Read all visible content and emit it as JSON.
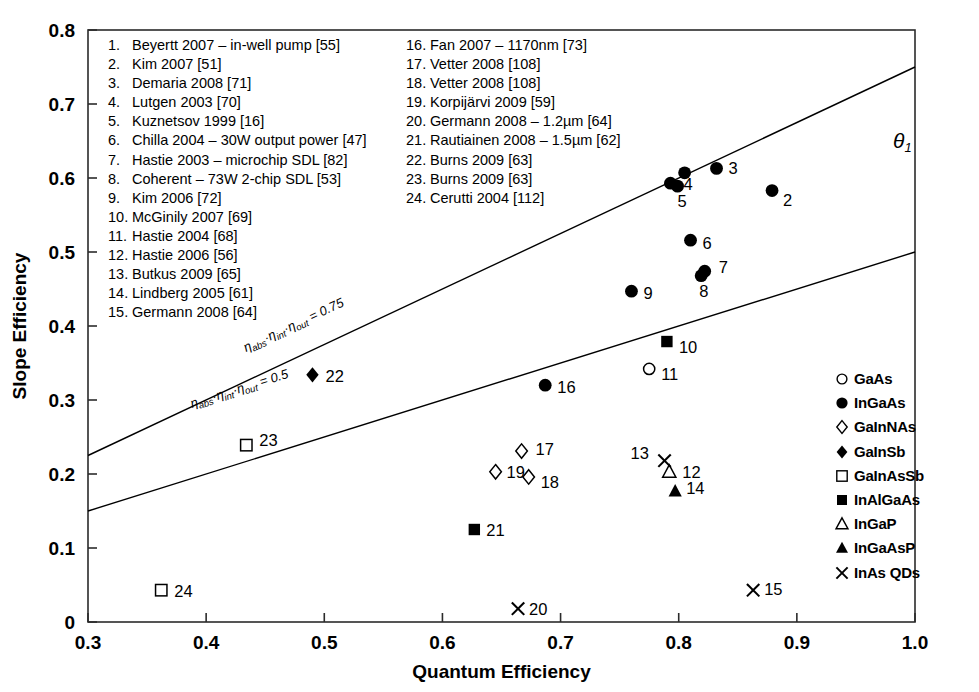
{
  "chart_data": {
    "type": "scatter",
    "title": "",
    "xlabel": "Quantum Efficiency",
    "ylabel": "Slope Efficiency",
    "xlim": [
      0.3,
      1.0
    ],
    "ylim": [
      0.0,
      0.8
    ],
    "xticks": [
      "0.3",
      "0.4",
      "0.5",
      "0.6",
      "0.7",
      "0.8",
      "0.9",
      "1.0"
    ],
    "xtick_values": [
      0.3,
      0.4,
      0.5,
      0.6,
      0.7,
      0.8,
      0.9,
      1.0
    ],
    "yticks": [
      "0",
      "0.1",
      "0.2",
      "0.3",
      "0.4",
      "0.5",
      "0.6",
      "0.7",
      "0.8"
    ],
    "ytick_values": [
      0.0,
      0.1,
      0.2,
      0.3,
      0.4,
      0.5,
      0.6,
      0.7,
      0.8
    ],
    "grid": false,
    "legend_position": "right-bottom",
    "points": [
      {
        "id": 1,
        "x": 0.793,
        "y": 0.593,
        "marker": "filled-circle",
        "material": "InGaAs",
        "label": "4",
        "label_dx": 13,
        "label_dy": 7
      },
      {
        "id": 2,
        "x": 0.879,
        "y": 0.583,
        "marker": "filled-circle",
        "material": "InGaAs",
        "label": "2",
        "label_dx": 11,
        "label_dy": 15
      },
      {
        "id": 3,
        "x": 0.832,
        "y": 0.613,
        "marker": "filled-circle",
        "material": "InGaAs",
        "label": "3",
        "label_dx": 12,
        "label_dy": 6
      },
      {
        "id": 4,
        "x": 0.805,
        "y": 0.607,
        "marker": "filled-circle",
        "material": "InGaAs",
        "label": "",
        "label_dx": 0,
        "label_dy": 0
      },
      {
        "id": 5,
        "x": 0.799,
        "y": 0.589,
        "marker": "filled-circle",
        "material": "InGaAs",
        "label": "5",
        "label_dx": 0,
        "label_dy": 21
      },
      {
        "id": 6,
        "x": 0.81,
        "y": 0.516,
        "marker": "filled-circle",
        "material": "InGaAs",
        "label": "6",
        "label_dx": 12,
        "label_dy": 9
      },
      {
        "id": 7,
        "x": 0.822,
        "y": 0.474,
        "marker": "filled-circle",
        "material": "InGaAs",
        "label": "7",
        "label_dx": 14,
        "label_dy": 2
      },
      {
        "id": 8,
        "x": 0.819,
        "y": 0.468,
        "marker": "filled-circle",
        "material": "InGaAs",
        "label": "8",
        "label_dx": -2,
        "label_dy": 21
      },
      {
        "id": 9,
        "x": 0.76,
        "y": 0.447,
        "marker": "filled-circle",
        "material": "InGaAs",
        "label": "9",
        "label_dx": 12,
        "label_dy": 8
      },
      {
        "id": 10,
        "x": 0.79,
        "y": 0.379,
        "marker": "filled-square",
        "material": "InAlGaAs",
        "label": "10",
        "label_dx": 12,
        "label_dy": 11
      },
      {
        "id": 11,
        "x": 0.775,
        "y": 0.342,
        "marker": "open-circle",
        "material": "GaAs",
        "label": "11",
        "label_dx": 12,
        "label_dy": 11
      },
      {
        "id": 12,
        "x": 0.792,
        "y": 0.203,
        "marker": "open-triangle",
        "material": "InGaP",
        "label": "12",
        "label_dx": 13,
        "label_dy": 6
      },
      {
        "id": 13,
        "x": 0.788,
        "y": 0.218,
        "marker": "cross",
        "material": "InAs QDs",
        "label": "13",
        "label_dx": -34,
        "label_dy": -2
      },
      {
        "id": 14,
        "x": 0.797,
        "y": 0.177,
        "marker": "filled-triangle",
        "material": "InGaAsP",
        "label": "14",
        "label_dx": 11,
        "label_dy": 3
      },
      {
        "id": 15,
        "x": 0.863,
        "y": 0.043,
        "marker": "cross",
        "material": "InAs QDs",
        "label": "15",
        "label_dx": 11,
        "label_dy": 5
      },
      {
        "id": 16,
        "x": 0.687,
        "y": 0.32,
        "marker": "filled-circle",
        "material": "InGaAs",
        "label": "16",
        "label_dx": 12,
        "label_dy": 8
      },
      {
        "id": 17,
        "x": 0.667,
        "y": 0.231,
        "marker": "open-diamond",
        "material": "GaInNAs",
        "label": "17",
        "label_dx": 14,
        "label_dy": 4
      },
      {
        "id": 18,
        "x": 0.673,
        "y": 0.196,
        "marker": "open-diamond",
        "material": "GaInNAs",
        "label": "18",
        "label_dx": 12,
        "label_dy": 11
      },
      {
        "id": 19,
        "x": 0.645,
        "y": 0.203,
        "marker": "open-diamond",
        "material": "GaInNAs",
        "label": "19",
        "label_dx": 11,
        "label_dy": 6
      },
      {
        "id": 20,
        "x": 0.664,
        "y": 0.018,
        "marker": "cross",
        "material": "InAs QDs",
        "label": "20",
        "label_dx": 11,
        "label_dy": 6
      },
      {
        "id": 21,
        "x": 0.627,
        "y": 0.125,
        "marker": "filled-square",
        "material": "InAlGaAs",
        "label": "21",
        "label_dx": 12,
        "label_dy": 6
      },
      {
        "id": 22,
        "x": 0.49,
        "y": 0.334,
        "marker": "filled-diamond",
        "material": "GaInSb",
        "label": "22",
        "label_dx": 13,
        "label_dy": 7
      },
      {
        "id": 23,
        "x": 0.434,
        "y": 0.239,
        "marker": "open-square",
        "material": "GaInAsSb",
        "label": "23",
        "label_dx": 13,
        "label_dy": 1
      },
      {
        "id": 24,
        "x": 0.362,
        "y": 0.043,
        "marker": "open-square",
        "material": "GaInAsSb",
        "label": "24",
        "label_dx": 13,
        "label_dy": 7
      }
    ],
    "trend_lines": [
      {
        "name": "eta-075",
        "x0": 0.3,
        "y0": 0.225,
        "x1": 1.0,
        "y1": 0.75,
        "label": "η abs · η int · η out = 0.75"
      },
      {
        "name": "eta-050",
        "x0": 0.3,
        "y0": 0.15,
        "x1": 1.0,
        "y1": 0.5,
        "label": "η abs · η int · η out = 0.5"
      }
    ],
    "line_label_parts": {
      "upper": {
        "eta1": "η",
        "sub1": "abs",
        "dot1": "·",
        "eta2": "η",
        "sub2": "int",
        "dot2": "·",
        "eta3": "η",
        "sub3": "out",
        "eq": "= 0.75"
      },
      "lower": {
        "eta1": "η",
        "sub1": "abs",
        "dot1": "·",
        "eta2": "η",
        "sub2": "int",
        "dot2": "·",
        "eta3": "η",
        "sub3": "out",
        "eq": "= 0.5"
      }
    },
    "annotation": {
      "text": "θ",
      "subscript": "1"
    }
  },
  "references": {
    "column_1": [
      {
        "num": "1.",
        "text": "Beyertt 2007 – in-well pump  [55]"
      },
      {
        "num": "2.",
        "text": "Kim 2007  [51]"
      },
      {
        "num": "3.",
        "text": "Demaria 2008  [71]"
      },
      {
        "num": "4.",
        "text": "Lutgen 2003  [70]"
      },
      {
        "num": "5.",
        "text": "Kuznetsov 1999  [16]"
      },
      {
        "num": "6.",
        "text": "Chilla 2004 – 30W output power  [47]"
      },
      {
        "num": "7.",
        "text": "Hastie 2003 – microchip SDL  [82]"
      },
      {
        "num": "8.",
        "text": "Coherent – 73W 2-chip SDL  [53]"
      },
      {
        "num": "9.",
        "text": "Kim 2006  [72]"
      },
      {
        "num": "10.",
        "text": "McGinily 2007  [69]"
      },
      {
        "num": "11.",
        "text": "Hastie 2004  [68]"
      },
      {
        "num": "12.",
        "text": "Hastie 2006  [56]"
      },
      {
        "num": "13.",
        "text": "Butkus 2009  [65]"
      },
      {
        "num": "14.",
        "text": "Lindberg 2005  [61]"
      },
      {
        "num": "15.",
        "text": "Germann 2008  [64]"
      }
    ],
    "column_2": [
      {
        "num": "16.",
        "text": "Fan 2007 – 1170nm  [73]"
      },
      {
        "num": "17.",
        "text": "Vetter 2008  [108]"
      },
      {
        "num": "18.",
        "text": "Vetter 2008  [108]"
      },
      {
        "num": "19.",
        "text": "Korpijärvi 2009  [59]"
      },
      {
        "num": "20.",
        "text": "Germann 2008 – 1.2µm  [64]"
      },
      {
        "num": "21.",
        "text": "Rautiainen 2008 – 1.5µm  [62]"
      },
      {
        "num": "22.",
        "text": "Burns 2009  [63]"
      },
      {
        "num": "23.",
        "text": "Burns 2009  [63]"
      },
      {
        "num": "24.",
        "text": "Cerutti 2004  [112]"
      }
    ]
  },
  "material_legend": [
    {
      "marker": "open-circle",
      "label": "GaAs"
    },
    {
      "marker": "filled-circle",
      "label": "InGaAs"
    },
    {
      "marker": "open-diamond",
      "label": "GaInNAs"
    },
    {
      "marker": "filled-diamond",
      "label": "GaInSb"
    },
    {
      "marker": "open-square",
      "label": "GaInAsSb"
    },
    {
      "marker": "filled-square",
      "label": "InAlGaAs"
    },
    {
      "marker": "open-triangle",
      "label": "InGaP"
    },
    {
      "marker": "filled-triangle",
      "label": "InGaAsP"
    },
    {
      "marker": "cross",
      "label": "InAs QDs"
    }
  ],
  "colors": {
    "ink": "#000000",
    "background": "#ffffff",
    "axis": "#1a1a1a"
  }
}
